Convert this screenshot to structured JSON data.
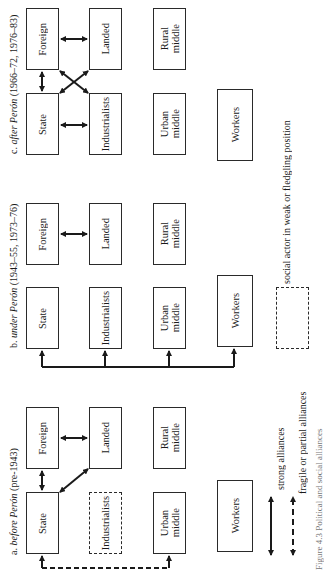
{
  "figure": {
    "caption": "Figure 4.3  Political and social alliances",
    "orientation": "rotated 90 degrees counter-clockwise"
  },
  "panels": [
    {
      "id": "a",
      "title_prefix": "a.",
      "title_italic": "before Perón",
      "title_suffix": "(pre-1943)",
      "actors": [
        {
          "label": "Foreign",
          "style": "solid"
        },
        {
          "label": "Landed",
          "style": "solid"
        },
        {
          "label": "Rural\nmiddle",
          "style": "solid"
        },
        {
          "label": "State",
          "style": "solid"
        },
        {
          "label": "Industrialists",
          "style": "dashed"
        },
        {
          "label": "Urban\nmiddle",
          "style": "solid"
        },
        {
          "label": "Workers",
          "style": "solid"
        }
      ],
      "alliances": [
        {
          "from": "State",
          "to": "Foreign",
          "type": "strong"
        },
        {
          "from": "Foreign",
          "to": "Landed",
          "type": "strong"
        },
        {
          "from": "State",
          "to": "Landed",
          "type": "strong"
        },
        {
          "from": "State",
          "to": "Urban middle",
          "type": "fragile"
        }
      ]
    },
    {
      "id": "b",
      "title_prefix": "b.",
      "title_italic": "under Perón",
      "title_suffix": "(1943–55, 1973–76)",
      "actors": [
        {
          "label": "Foreign",
          "style": "solid"
        },
        {
          "label": "Landed",
          "style": "solid"
        },
        {
          "label": "Rural\nmiddle",
          "style": "solid"
        },
        {
          "label": "State",
          "style": "solid"
        },
        {
          "label": "Industrialists",
          "style": "solid"
        },
        {
          "label": "Urban\nmiddle",
          "style": "solid"
        },
        {
          "label": "Workers",
          "style": "solid"
        }
      ],
      "alliances": [
        {
          "from": "Foreign",
          "to": "Landed",
          "type": "strong"
        },
        {
          "from": "State",
          "to": [
            "Industrialists",
            "Urban middle",
            "Workers"
          ],
          "type": "strong"
        }
      ]
    },
    {
      "id": "c",
      "title_prefix": "c.",
      "title_italic": "after Perón",
      "title_suffix": "(1966–72, 1976–83)",
      "actors": [
        {
          "label": "Foreign",
          "style": "solid"
        },
        {
          "label": "Landed",
          "style": "solid"
        },
        {
          "label": "Rural\nmiddle",
          "style": "solid"
        },
        {
          "label": "State",
          "style": "solid"
        },
        {
          "label": "Industrialists",
          "style": "solid"
        },
        {
          "label": "Urban\nmiddle",
          "style": "solid"
        },
        {
          "label": "Workers",
          "style": "solid"
        }
      ],
      "alliances": [
        {
          "from": "State",
          "to": "Foreign",
          "type": "strong"
        },
        {
          "from": "Foreign",
          "to": "Landed",
          "type": "strong"
        },
        {
          "from": "State",
          "to": "Industrialists",
          "type": "strong"
        },
        {
          "from": "State",
          "to": "Landed",
          "type": "strong"
        },
        {
          "from": "Foreign",
          "to": "Industrialists",
          "type": "strong"
        }
      ]
    }
  ],
  "legend": {
    "strong": "strong alliances",
    "fragile": "fragile or partial alliances",
    "weak_actor": "social actor in weak\nor fledgling position"
  },
  "colors": {
    "ink": "#1a1a1a",
    "border": "#2a2a2a",
    "background": "#ffffff"
  }
}
